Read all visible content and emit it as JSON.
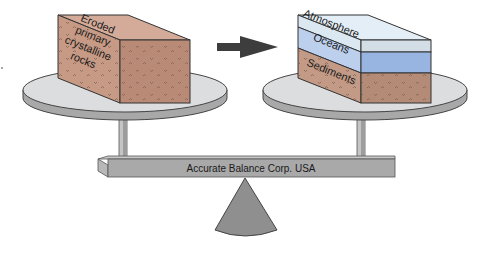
{
  "diagram": {
    "left_block": {
      "label_lines": [
        "Eroded",
        "primary",
        "crystalline",
        "rocks"
      ],
      "color_front": "#c79a86",
      "color_side": "#b98a76",
      "color_top": "#d4ab98"
    },
    "arrow": {
      "direction": "right",
      "color": "#3d3d3d"
    },
    "right_block": {
      "layers": [
        {
          "label": "Atmosphere",
          "color": "#dbe8f2"
        },
        {
          "label": "Oceans",
          "color": "#a9c2e6"
        },
        {
          "label": "Sediments",
          "color": "#c39a86"
        }
      ]
    },
    "balance": {
      "beam_label": "Accurate Balance Corp.  USA",
      "pan_color": "#d9dadb",
      "beam_color": "#a9a9a9",
      "base_color": "#8f8f8f"
    }
  }
}
